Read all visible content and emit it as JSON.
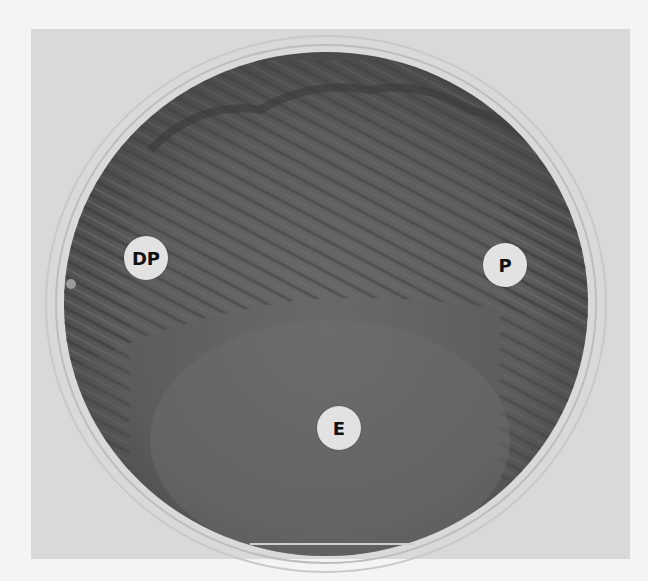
{
  "image": {
    "subject": "Agar plate (petri dish) with bacterial streaks and three labeled discs",
    "background_color": "#f4f4f4",
    "panel_color": "#d9d9d9",
    "dish_color": "#5a5a5a",
    "labels": [
      {
        "id": "dp",
        "text": "DP",
        "x": 146,
        "y": 258
      },
      {
        "id": "p",
        "text": "P",
        "x": 505,
        "y": 265
      },
      {
        "id": "e",
        "text": "E",
        "x": 339,
        "y": 428
      }
    ]
  }
}
